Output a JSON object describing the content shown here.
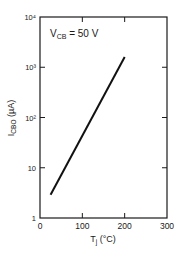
{
  "chart_data": {
    "type": "line",
    "title": "",
    "annotation": "V_CB = 50 V",
    "annotation_parts": {
      "main": "V",
      "sub": "CB",
      "rest": " = 50 V"
    },
    "xlabel": "T_j (°C)",
    "xlabel_parts": {
      "main": "T",
      "sub": "j",
      "rest": " (°C)"
    },
    "ylabel": "I_CBO (µA)",
    "ylabel_parts": {
      "main": "I",
      "sub": "CBO",
      "rest": " (µA)"
    },
    "xlim": [
      0,
      300
    ],
    "ylim": [
      1,
      10000
    ],
    "yscale": "log",
    "xticks": [
      0,
      100,
      200,
      300
    ],
    "xtick_labels": [
      "0",
      "100",
      "200",
      "300"
    ],
    "yticks": [
      1,
      10,
      100,
      1000,
      10000
    ],
    "ytick_labels": [
      "1",
      "10",
      "10²",
      "10³",
      "10⁴"
    ],
    "grid": false,
    "series": [
      {
        "name": "I_CBO",
        "x": [
          25,
          200
        ],
        "y": [
          2.9,
          1600
        ]
      }
    ]
  }
}
